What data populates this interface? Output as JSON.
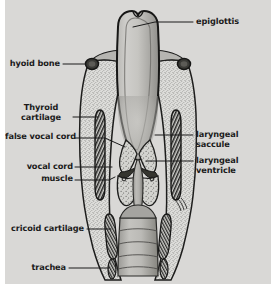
{
  "figure": {
    "kind": "anatomical-illustration",
    "background_color": "#d9d8d6",
    "ink_color": "#1b1b1b",
    "page_color": "#ffffff"
  },
  "labels": [
    {
      "id": "epiglottis",
      "text": "epiglottis",
      "align": "left",
      "x": 196,
      "y": 18,
      "leader": {
        "x1": 193,
        "y1": 22,
        "x2": 152,
        "y2": 22,
        "x3": 130,
        "y3": 27
      }
    },
    {
      "id": "hyoid-bone",
      "text": "hyoid bone",
      "align": "right",
      "x": 12,
      "y": 60,
      "leader": {
        "x1": 63,
        "y1": 64,
        "x2": 83,
        "y2": 64,
        "x3": 83,
        "y3": 64
      }
    },
    {
      "id": "thyroid-cartilage",
      "text": "Thyroid\ncartilage",
      "align": "right",
      "x": 13,
      "y": 105,
      "leader": {
        "x1": 72,
        "y1": 117,
        "x2": 96,
        "y2": 117,
        "x3": 96,
        "y3": 117
      }
    },
    {
      "id": "false-vocal-cord",
      "text": "false vocal cord",
      "align": "right",
      "x": 3,
      "y": 134,
      "leader": {
        "x1": 73,
        "y1": 138,
        "x2": 118,
        "y2": 145,
        "x3": 118,
        "y3": 145
      }
    },
    {
      "id": "vocal-cord",
      "text": "vocal cord",
      "align": "right",
      "x": 20,
      "y": 163,
      "leader": {
        "x1": 74,
        "y1": 167,
        "x2": 109,
        "y2": 167,
        "x3": 109,
        "y3": 167
      }
    },
    {
      "id": "muscle",
      "text": "muscle",
      "align": "right",
      "x": 31,
      "y": 176,
      "leader": {
        "x1": 74,
        "y1": 180,
        "x2": 111,
        "y2": 177,
        "x3": 111,
        "y3": 177
      }
    },
    {
      "id": "cricoid-cartilage",
      "text": "cricoid cartilage",
      "align": "right",
      "x": 7,
      "y": 225,
      "leader": {
        "x1": 85,
        "y1": 229,
        "x2": 112,
        "y2": 229,
        "x3": 112,
        "y3": 229
      }
    },
    {
      "id": "trachea",
      "text": "trachea",
      "align": "right",
      "x": 23,
      "y": 264,
      "leader": {
        "x1": 67,
        "y1": 268,
        "x2": 113,
        "y2": 268,
        "x3": 113,
        "y3": 268
      }
    },
    {
      "id": "laryngeal-saccule",
      "text": "laryngeal\nsaccule",
      "align": "left",
      "x": 196,
      "y": 131,
      "leader": {
        "x1": 193,
        "y1": 135,
        "x2": 152,
        "y2": 135,
        "x3": 152,
        "y3": 135
      }
    },
    {
      "id": "laryngeal-ventricle",
      "text": "laryngeal\nventricle",
      "align": "left",
      "x": 196,
      "y": 157,
      "leader": {
        "x1": 193,
        "y1": 161,
        "x2": 144,
        "y2": 161,
        "x3": 144,
        "y3": 161
      }
    }
  ],
  "structures": [
    {
      "id": "epiglottis-body",
      "name": "epiglottis"
    },
    {
      "id": "hyoid-bone-left",
      "name": "hyoid bone (left)"
    },
    {
      "id": "hyoid-bone-right",
      "name": "hyoid bone (right)"
    },
    {
      "id": "thyroid-cartilage-left",
      "name": "thyroid cartilage (left)"
    },
    {
      "id": "thyroid-cartilage-right",
      "name": "thyroid cartilage (right)"
    },
    {
      "id": "false-vocal-cord-left",
      "name": "false vocal cord (left)"
    },
    {
      "id": "false-vocal-cord-right",
      "name": "false vocal cord (right)"
    },
    {
      "id": "vocal-cord-muscle-left",
      "name": "vocal cord muscle (left)"
    },
    {
      "id": "vocal-cord-muscle-right",
      "name": "vocal cord muscle (right)"
    },
    {
      "id": "laryngeal-ventricle-left",
      "name": "laryngeal ventricle (left)"
    },
    {
      "id": "laryngeal-ventricle-right",
      "name": "laryngeal ventricle (right)"
    },
    {
      "id": "cricoid-cartilage-left",
      "name": "cricoid cartilage (left)"
    },
    {
      "id": "cricoid-cartilage-right",
      "name": "cricoid cartilage (right)"
    },
    {
      "id": "trachea-lumen",
      "name": "trachea"
    },
    {
      "id": "tracheal-ring-1",
      "name": "tracheal ring"
    },
    {
      "id": "tracheal-ring-2",
      "name": "tracheal ring"
    },
    {
      "id": "tracheal-ring-3",
      "name": "tracheal ring"
    },
    {
      "id": "tracheal-ring-4",
      "name": "tracheal ring"
    }
  ]
}
